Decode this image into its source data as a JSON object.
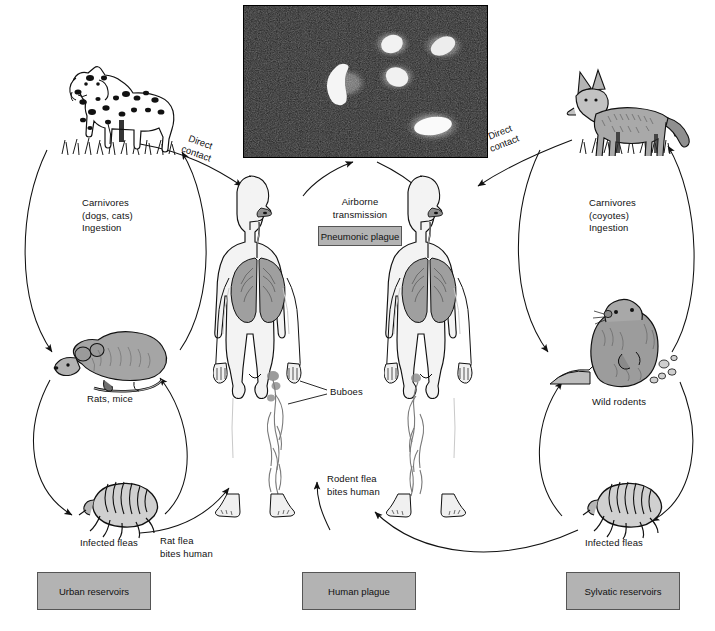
{
  "figure": {
    "background_color": "#ffffff",
    "box_fill_color": "#b3b3b3",
    "line_color": "#111111"
  },
  "micrograph": {
    "name": "fluorescent-antibody-stain-of-plague-bacilli",
    "background_color": "#161616",
    "bacilli_color": "#f2f2f2",
    "bacilli_count": 5
  },
  "labels": {
    "carnivores_left": "Carnivores\n(dogs, cats)\nIngestion",
    "carnivores_right": "Carnivores\n(coyotes)\nIngestion",
    "rats_mice": "Rats, mice",
    "wild_rodents": "Wild rodents",
    "infected_fleas_left": "Infected fleas",
    "infected_fleas_right": "Infected fleas",
    "direct_contact_left": "Direct\ncontact",
    "direct_contact_right": "Direct\ncontact",
    "airborne_transmission": "Airborne\ntransmission",
    "rat_flea_bites_human": "Rat flea\nbites human",
    "rodent_flea_bites_human": "Rodent flea\nbites human",
    "buboes": "Buboes"
  },
  "boxes": {
    "pneumonic_plague": "Pneumonic plague",
    "urban_reservoirs": "Urban reservoirs",
    "human_plague": "Human plague",
    "sylvatic_reservoirs": "Sylvatic reservoirs"
  },
  "artwork": {
    "dog": "dalmatian-dog-illustration",
    "coyote": "coyote-illustration",
    "rat": "rat-illustration",
    "marmot": "wild-rodent-marmot-illustration",
    "flea_left": "flea-illustration",
    "flea_right": "flea-illustration",
    "human_left": "human-figure-anatomy-illustration",
    "human_right": "human-figure-anatomy-illustration"
  },
  "colors": {
    "animal_fill": "#9a9a9a",
    "animal_fill_light": "#c8c8c8",
    "lung_fill": "#9d9d9d",
    "body_fill": "#f3f3f3",
    "grass": "#222222"
  }
}
